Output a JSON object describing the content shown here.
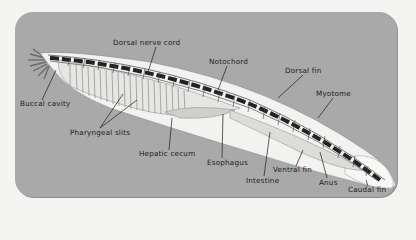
{
  "diagram": {
    "labels": {
      "dorsal_nerve_cord": "Dorsal nerve cord",
      "notochord": "Notochord",
      "dorsal_fin": "Dorsal fin",
      "myotome": "Myotome",
      "buccal_cavity": "Buccal cavity",
      "pharyngeal_slits": "Pharyngeal slits",
      "hepatic_cecum": "Hepatic cecum",
      "esophagus": "Esophagus",
      "ventral_fin": "Ventral fin",
      "intestine": "Intestine",
      "anus": "Anus",
      "caudal_fin": "Caudal fin"
    },
    "colors": {
      "panel": "#a9a9a9",
      "page": "#f4f4f2",
      "body": "#f2f2f0",
      "segments": "#111111",
      "leader_lines": "#1c1c1c"
    }
  }
}
